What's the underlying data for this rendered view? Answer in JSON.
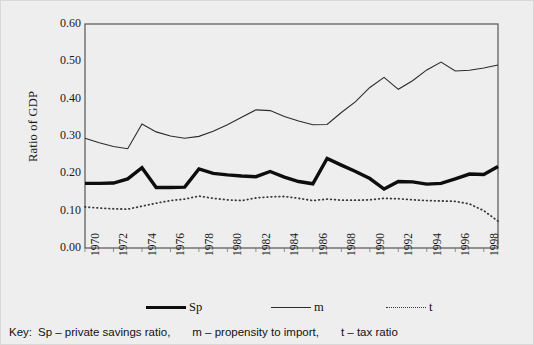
{
  "chart_data": {
    "type": "line",
    "title": "",
    "xlabel": "",
    "ylabel": "Ratio of GDP",
    "ylim": [
      0.0,
      0.6
    ],
    "ytick_labels": [
      "0.00",
      "0.10",
      "0.20",
      "0.30",
      "0.40",
      "0.50",
      "0.60"
    ],
    "ytick_values": [
      0.0,
      0.1,
      0.2,
      0.3,
      0.4,
      0.5,
      0.6
    ],
    "xlim": [
      1970,
      1999
    ],
    "xtick_labels": [
      "1970",
      "1972",
      "1974",
      "1976",
      "1978",
      "1980",
      "1982",
      "1984",
      "1986",
      "1988",
      "1990",
      "1992",
      "1994",
      "1996",
      "1998"
    ],
    "x": [
      1970,
      1971,
      1972,
      1973,
      1974,
      1975,
      1976,
      1977,
      1978,
      1979,
      1980,
      1981,
      1982,
      1983,
      1984,
      1985,
      1986,
      1987,
      1988,
      1989,
      1990,
      1991,
      1992,
      1993,
      1994,
      1995,
      1996,
      1997,
      1998,
      1999
    ],
    "grid": false,
    "legend_position": "bottom",
    "series": [
      {
        "name": "Sp",
        "style": "thick-solid",
        "color": "#0d0d0d",
        "values": [
          0.173,
          0.173,
          0.174,
          0.185,
          0.215,
          0.162,
          0.162,
          0.163,
          0.212,
          0.2,
          0.196,
          0.193,
          0.191,
          0.205,
          0.19,
          0.178,
          0.172,
          0.24,
          0.222,
          0.205,
          0.186,
          0.158,
          0.178,
          0.177,
          0.171,
          0.173,
          0.185,
          0.198,
          0.197,
          0.218
        ]
      },
      {
        "name": "m",
        "style": "thin-solid",
        "color": "#2b2b2b",
        "values": [
          0.294,
          0.282,
          0.272,
          0.266,
          0.332,
          0.311,
          0.3,
          0.294,
          0.299,
          0.313,
          0.33,
          0.35,
          0.37,
          0.368,
          0.352,
          0.34,
          0.33,
          0.331,
          0.363,
          0.392,
          0.43,
          0.457,
          0.425,
          0.448,
          0.477,
          0.498,
          0.474,
          0.476,
          0.482,
          0.49
        ]
      },
      {
        "name": "t",
        "style": "dotted",
        "color": "#3a3a3a",
        "values": [
          0.11,
          0.107,
          0.105,
          0.104,
          0.112,
          0.12,
          0.127,
          0.131,
          0.139,
          0.133,
          0.129,
          0.127,
          0.134,
          0.137,
          0.138,
          0.133,
          0.127,
          0.131,
          0.128,
          0.128,
          0.129,
          0.133,
          0.132,
          0.129,
          0.127,
          0.126,
          0.125,
          0.118,
          0.1,
          0.072
        ]
      }
    ]
  },
  "legend": {
    "items": [
      {
        "label": "Sp",
        "style": "thick-solid"
      },
      {
        "label": "m",
        "style": "thin-solid"
      },
      {
        "label": "t",
        "style": "dotted"
      }
    ]
  },
  "key": {
    "prefix": "Key:",
    "entries": [
      "Sp – private savings ratio,",
      "m – propensity to import,",
      "t – tax ratio"
    ]
  }
}
